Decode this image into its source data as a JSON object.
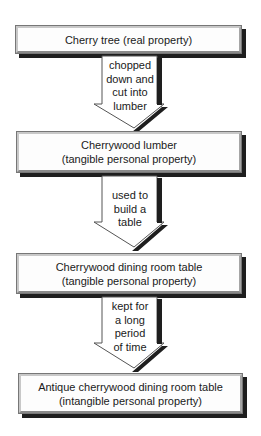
{
  "diagram": {
    "boxes": [
      {
        "line1": "Cherry tree (real property)",
        "line2": ""
      },
      {
        "line1": "Cherrywood lumber",
        "line2": "(tangible personal property)"
      },
      {
        "line1": "Cherrywood dining room table",
        "line2": "(tangible personal property)"
      },
      {
        "line1": "Antique cherrywood dining room table",
        "line2": "(intangible personal property)"
      }
    ],
    "arrows": [
      {
        "lines": [
          "chopped",
          "down and",
          "cut into",
          "lumber"
        ]
      },
      {
        "lines": [
          "used to",
          "build a",
          "table"
        ]
      },
      {
        "lines": [
          "kept for",
          "a long",
          "period",
          "of time"
        ]
      }
    ]
  }
}
